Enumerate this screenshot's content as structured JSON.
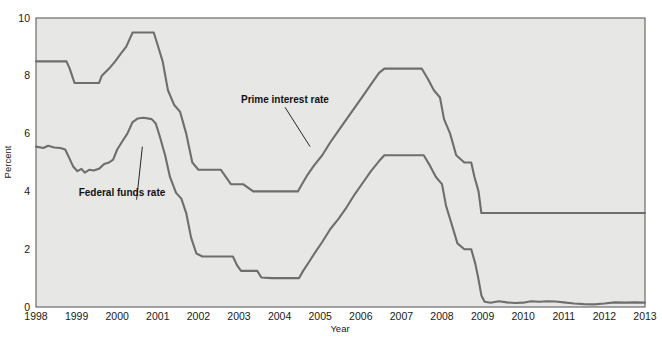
{
  "chart_data": {
    "type": "line",
    "title": "",
    "xlabel": "Year",
    "ylabel": "Percent",
    "xlim": [
      1998,
      2013
    ],
    "ylim": [
      0,
      10
    ],
    "xticks": [
      "1998",
      "1999",
      "2000",
      "2001",
      "2002",
      "2003",
      "2004",
      "2005",
      "2006",
      "2007",
      "2008",
      "2009",
      "2010",
      "2011",
      "2012",
      "2013"
    ],
    "yticks": [
      "0",
      "2",
      "4",
      "6",
      "8",
      "10"
    ],
    "grid": false,
    "legend": "inline annotations",
    "line_color": "#6e6e6e",
    "plot_bg": "#e7e7e5",
    "annotations": [
      {
        "label": "Prime interest rate",
        "x": 2003.05,
        "y": 7.05,
        "leader_to_x": 2004.75,
        "leader_to_y": 5.55
      },
      {
        "label": "Federal funds rate",
        "x": 1999.05,
        "y": 3.85,
        "leader_to_x": 2000.62,
        "leader_to_y": 5.55
      }
    ],
    "series": [
      {
        "name": "Prime interest rate",
        "points": [
          [
            1998.0,
            8.5
          ],
          [
            1998.75,
            8.5
          ],
          [
            1998.83,
            8.25
          ],
          [
            1998.95,
            7.75
          ],
          [
            1999.05,
            7.75
          ],
          [
            1999.55,
            7.75
          ],
          [
            1999.62,
            8.0
          ],
          [
            1999.8,
            8.25
          ],
          [
            1999.95,
            8.5
          ],
          [
            2000.08,
            8.75
          ],
          [
            2000.22,
            9.0
          ],
          [
            2000.38,
            9.5
          ],
          [
            2000.55,
            9.5
          ],
          [
            2000.9,
            9.5
          ],
          [
            2001.0,
            9.05
          ],
          [
            2001.12,
            8.5
          ],
          [
            2001.25,
            7.5
          ],
          [
            2001.4,
            7.0
          ],
          [
            2001.55,
            6.75
          ],
          [
            2001.7,
            6.0
          ],
          [
            2001.85,
            5.0
          ],
          [
            2002.0,
            4.75
          ],
          [
            2002.4,
            4.75
          ],
          [
            2002.55,
            4.75
          ],
          [
            2002.8,
            4.25
          ],
          [
            2003.1,
            4.25
          ],
          [
            2003.35,
            4.0
          ],
          [
            2003.6,
            4.0
          ],
          [
            2004.1,
            4.0
          ],
          [
            2004.45,
            4.0
          ],
          [
            2004.55,
            4.25
          ],
          [
            2004.7,
            4.6
          ],
          [
            2004.85,
            4.9
          ],
          [
            2005.05,
            5.25
          ],
          [
            2005.25,
            5.7
          ],
          [
            2005.45,
            6.1
          ],
          [
            2005.65,
            6.5
          ],
          [
            2005.85,
            6.9
          ],
          [
            2006.05,
            7.3
          ],
          [
            2006.25,
            7.7
          ],
          [
            2006.45,
            8.1
          ],
          [
            2006.58,
            8.25
          ],
          [
            2006.8,
            8.25
          ],
          [
            2007.5,
            8.25
          ],
          [
            2007.65,
            7.9
          ],
          [
            2007.8,
            7.5
          ],
          [
            2007.95,
            7.25
          ],
          [
            2008.05,
            6.5
          ],
          [
            2008.2,
            6.0
          ],
          [
            2008.35,
            5.25
          ],
          [
            2008.55,
            5.0
          ],
          [
            2008.72,
            5.0
          ],
          [
            2008.8,
            4.5
          ],
          [
            2008.9,
            4.0
          ],
          [
            2008.97,
            3.25
          ],
          [
            2009.1,
            3.25
          ],
          [
            2010.0,
            3.25
          ],
          [
            2011.0,
            3.25
          ],
          [
            2012.0,
            3.25
          ],
          [
            2013.0,
            3.25
          ]
        ]
      },
      {
        "name": "Federal funds rate",
        "points": [
          [
            1998.0,
            5.55
          ],
          [
            1998.18,
            5.5
          ],
          [
            1998.3,
            5.58
          ],
          [
            1998.45,
            5.52
          ],
          [
            1998.6,
            5.5
          ],
          [
            1998.72,
            5.45
          ],
          [
            1998.82,
            5.15
          ],
          [
            1998.92,
            4.85
          ],
          [
            1999.02,
            4.7
          ],
          [
            1999.12,
            4.78
          ],
          [
            1999.2,
            4.65
          ],
          [
            1999.32,
            4.75
          ],
          [
            1999.42,
            4.72
          ],
          [
            1999.55,
            4.78
          ],
          [
            1999.68,
            4.95
          ],
          [
            1999.8,
            5.0
          ],
          [
            1999.9,
            5.1
          ],
          [
            2000.0,
            5.45
          ],
          [
            2000.12,
            5.72
          ],
          [
            2000.25,
            6.0
          ],
          [
            2000.38,
            6.4
          ],
          [
            2000.5,
            6.52
          ],
          [
            2000.65,
            6.55
          ],
          [
            2000.85,
            6.5
          ],
          [
            2000.95,
            6.35
          ],
          [
            2001.05,
            5.9
          ],
          [
            2001.18,
            5.25
          ],
          [
            2001.3,
            4.5
          ],
          [
            2001.45,
            3.95
          ],
          [
            2001.58,
            3.75
          ],
          [
            2001.7,
            3.25
          ],
          [
            2001.82,
            2.4
          ],
          [
            2001.95,
            1.85
          ],
          [
            2002.1,
            1.75
          ],
          [
            2002.5,
            1.75
          ],
          [
            2002.85,
            1.75
          ],
          [
            2002.95,
            1.45
          ],
          [
            2003.05,
            1.25
          ],
          [
            2003.45,
            1.25
          ],
          [
            2003.55,
            1.02
          ],
          [
            2003.8,
            1.0
          ],
          [
            2004.2,
            1.0
          ],
          [
            2004.48,
            1.0
          ],
          [
            2004.58,
            1.25
          ],
          [
            2004.72,
            1.55
          ],
          [
            2004.88,
            1.9
          ],
          [
            2005.05,
            2.25
          ],
          [
            2005.25,
            2.7
          ],
          [
            2005.45,
            3.05
          ],
          [
            2005.65,
            3.45
          ],
          [
            2005.85,
            3.9
          ],
          [
            2006.05,
            4.3
          ],
          [
            2006.25,
            4.7
          ],
          [
            2006.45,
            5.05
          ],
          [
            2006.58,
            5.25
          ],
          [
            2006.8,
            5.25
          ],
          [
            2007.55,
            5.25
          ],
          [
            2007.7,
            4.9
          ],
          [
            2007.85,
            4.5
          ],
          [
            2008.0,
            4.25
          ],
          [
            2008.1,
            3.5
          ],
          [
            2008.22,
            2.95
          ],
          [
            2008.38,
            2.2
          ],
          [
            2008.55,
            2.0
          ],
          [
            2008.72,
            2.0
          ],
          [
            2008.82,
            1.5
          ],
          [
            2008.9,
            0.95
          ],
          [
            2008.97,
            0.4
          ],
          [
            2009.05,
            0.18
          ],
          [
            2009.2,
            0.15
          ],
          [
            2009.4,
            0.2
          ],
          [
            2009.6,
            0.16
          ],
          [
            2009.8,
            0.14
          ],
          [
            2010.0,
            0.15
          ],
          [
            2010.2,
            0.2
          ],
          [
            2010.4,
            0.18
          ],
          [
            2010.6,
            0.2
          ],
          [
            2010.8,
            0.19
          ],
          [
            2011.0,
            0.16
          ],
          [
            2011.25,
            0.12
          ],
          [
            2011.5,
            0.1
          ],
          [
            2011.75,
            0.09
          ],
          [
            2012.0,
            0.12
          ],
          [
            2012.25,
            0.16
          ],
          [
            2012.5,
            0.15
          ],
          [
            2012.75,
            0.16
          ],
          [
            2013.0,
            0.15
          ]
        ]
      }
    ]
  }
}
